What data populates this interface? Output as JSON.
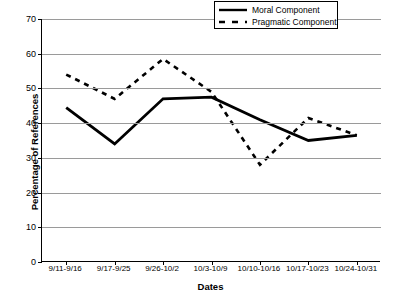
{
  "chart_data": {
    "type": "line",
    "title": "",
    "xlabel": "Dates",
    "ylabel": "Percentage of References",
    "categories": [
      "9/11-9/16",
      "9/17-9/25",
      "9/26-10/2",
      "10/3-10/9",
      "10/10-10/16",
      "10/17-10/23",
      "10/24-10/31"
    ],
    "series": [
      {
        "name": "Moral Component",
        "style": "solid",
        "color": "#000000",
        "values": [
          44.5,
          34,
          47,
          47.5,
          41,
          35,
          36.5
        ]
      },
      {
        "name": "Pragmatic Component",
        "style": "dashed",
        "color": "#000000",
        "values": [
          54,
          47,
          58.5,
          49,
          28,
          41.5,
          36.5
        ]
      }
    ],
    "ylim": [
      0,
      70
    ],
    "ytick_step": 10,
    "yticks": [
      "0",
      "10",
      "20",
      "30",
      "40",
      "50",
      "60",
      "70"
    ],
    "grid": true,
    "grid_color": "#9a9a9a",
    "legend_position": "top-right"
  },
  "legend": {
    "items": [
      {
        "label": "Moral Component"
      },
      {
        "label": "Pragmatic Component"
      }
    ]
  }
}
